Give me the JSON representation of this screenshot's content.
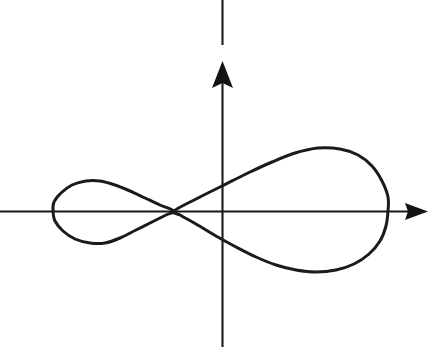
{
  "figure": {
    "background_color": "#ffffff",
    "ink_color": "#1b1b1b",
    "width": 431,
    "height": 347
  },
  "axes": {
    "origin": {
      "x": 222,
      "y": 211
    },
    "x_axis": {
      "label": "",
      "start_x": 0,
      "end_x": 428,
      "y": 211,
      "arrow_direction": "right",
      "arrow_tip_x": 428
    },
    "y_axis": {
      "label": "",
      "x": 222,
      "top_segment_start_y": 0,
      "top_segment_end_y": 45,
      "gap_start_y": 45,
      "gap_end_y": 61,
      "arrow_tip_y": 61,
      "end_y": 347,
      "arrow_direction": "up"
    }
  },
  "chart_data": {
    "type": "line",
    "subtitle": "",
    "xlabel": "",
    "ylabel": "",
    "grid": false,
    "legend": false,
    "axis_origin_px": [
      222,
      211
    ],
    "xlim_px": [
      0,
      431
    ],
    "ylim_px": [
      0,
      347
    ],
    "annotations": [],
    "series": [
      {
        "name": "node",
        "kind": "point",
        "points": [
          [
            174,
            211
          ]
        ],
        "description": "self-intersection / double point of the curve"
      },
      {
        "name": "left-loop",
        "kind": "closed-loop",
        "description": "small left-hand loop of the curve",
        "extrema_px": {
          "leftmost": [
            53,
            211
          ],
          "topmost": [
            95,
            181
          ],
          "bottommost": [
            100,
            243
          ],
          "rightmost": [
            174,
            211
          ]
        },
        "points": [
          [
            174,
            211
          ],
          [
            160,
            205
          ],
          [
            145,
            198
          ],
          [
            130,
            191
          ],
          [
            115,
            185
          ],
          [
            100,
            181
          ],
          [
            86,
            181
          ],
          [
            72,
            185
          ],
          [
            61,
            193
          ],
          [
            54,
            202
          ],
          [
            53,
            211
          ],
          [
            55,
            221
          ],
          [
            63,
            231
          ],
          [
            75,
            239
          ],
          [
            90,
            243
          ],
          [
            105,
            243
          ],
          [
            120,
            238
          ],
          [
            136,
            230
          ],
          [
            152,
            222
          ],
          [
            166,
            215
          ],
          [
            174,
            211
          ]
        ]
      },
      {
        "name": "right-loop",
        "kind": "closed-loop",
        "description": "large right-hand loop of the curve",
        "extrema_px": {
          "leftmost": [
            174,
            211
          ],
          "topmost": [
            322,
            148
          ],
          "bottommost": [
            310,
            272
          ],
          "rightmost": [
            388,
            211
          ]
        },
        "points": [
          [
            174,
            211
          ],
          [
            196,
            199
          ],
          [
            222,
            186
          ],
          [
            248,
            173
          ],
          [
            272,
            162
          ],
          [
            295,
            153
          ],
          [
            318,
            148
          ],
          [
            340,
            149
          ],
          [
            358,
            155
          ],
          [
            372,
            166
          ],
          [
            382,
            181
          ],
          [
            388,
            197
          ],
          [
            388,
            211
          ],
          [
            386,
            226
          ],
          [
            380,
            241
          ],
          [
            369,
            254
          ],
          [
            354,
            264
          ],
          [
            336,
            270
          ],
          [
            316,
            272
          ],
          [
            296,
            270
          ],
          [
            276,
            265
          ],
          [
            256,
            257
          ],
          [
            236,
            247
          ],
          [
            216,
            236
          ],
          [
            196,
            224
          ],
          [
            180,
            215
          ],
          [
            174,
            211
          ]
        ]
      }
    ]
  }
}
